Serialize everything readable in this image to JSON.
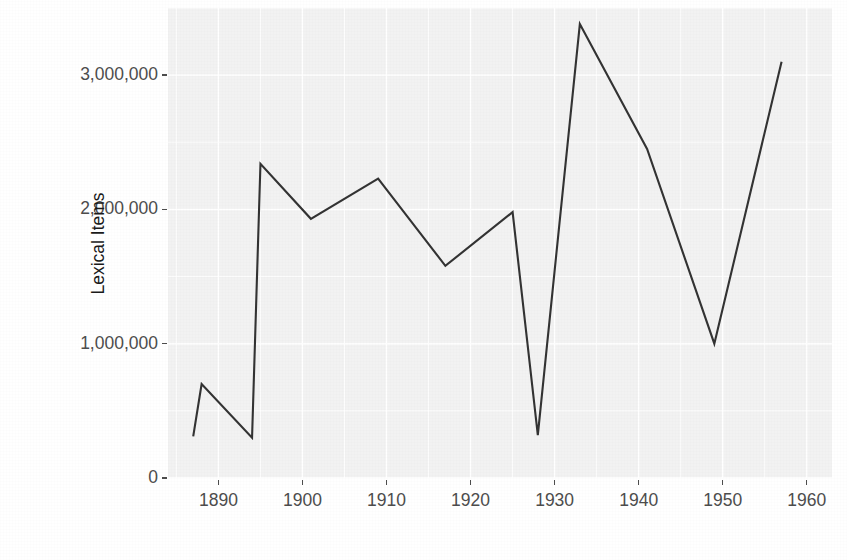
{
  "chart_data": {
    "type": "line",
    "title": "",
    "xlabel": "",
    "ylabel": "Lexical Items",
    "xlim": [
      1884,
      1963
    ],
    "ylim": [
      0,
      3500000
    ],
    "grid": true,
    "legend": "none",
    "line_color": "#333333",
    "panel_color": "#f2f2f2",
    "gridline_color": "#ffffff",
    "axis_text_color": "#4d4d4d",
    "x": [
      1887,
      1888,
      1894,
      1895,
      1901,
      1909,
      1917,
      1925,
      1928,
      1933,
      1941,
      1949,
      1957
    ],
    "y": [
      310000,
      700000,
      300000,
      2340000,
      1930000,
      2230000,
      1580000,
      1980000,
      320000,
      3380000,
      2450000,
      1000000,
      3100000
    ],
    "points": [
      {
        "x": 1887,
        "y": 310000
      },
      {
        "x": 1888,
        "y": 700000
      },
      {
        "x": 1894,
        "y": 300000
      },
      {
        "x": 1895,
        "y": 2340000
      },
      {
        "x": 1901,
        "y": 1930000
      },
      {
        "x": 1909,
        "y": 2230000
      },
      {
        "x": 1917,
        "y": 1580000
      },
      {
        "x": 1925,
        "y": 1980000
      },
      {
        "x": 1928,
        "y": 320000
      },
      {
        "x": 1933,
        "y": 3380000
      },
      {
        "x": 1941,
        "y": 2450000
      },
      {
        "x": 1949,
        "y": 1000000
      },
      {
        "x": 1957,
        "y": 3100000
      }
    ],
    "yticks": [
      0,
      1000000,
      2000000,
      3000000
    ],
    "ytick_labels": [
      "0",
      "1,000,000",
      "2,000,000",
      "3,000,000"
    ],
    "xticks": [
      1890,
      1900,
      1910,
      1920,
      1930,
      1940,
      1950,
      1960
    ],
    "xtick_labels": [
      "1890",
      "1900",
      "1910",
      "1920",
      "1930",
      "1940",
      "1950",
      "1960"
    ]
  }
}
